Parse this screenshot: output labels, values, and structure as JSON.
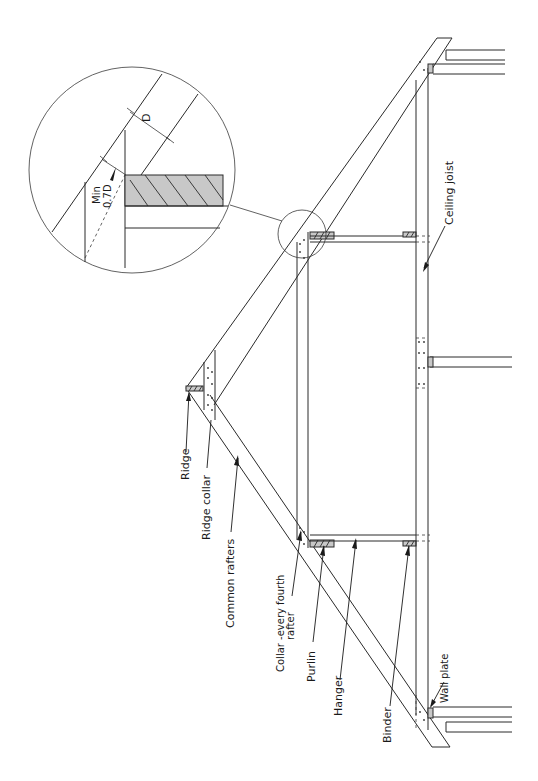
{
  "diagram": {
    "orientation": "rotated 90 degrees counter-clockwise",
    "labels": {
      "ridge": "Ridge",
      "ridge_collar": "Ridge collar",
      "common_rafters": "Common rafters",
      "collar_line1": "Collar -every fourth",
      "collar_line2": "rafter",
      "purlin": "Purlin",
      "hanger": "Hanger",
      "binder": "Binder",
      "wall_plate": "Wall plate",
      "ceiling_joist": "Ceiling joist"
    },
    "detail": {
      "name": "Purlin bearing detail",
      "min_label": "Min",
      "min_value": "0.7D",
      "depth_label": "D"
    },
    "colors": {
      "line": "#2a2a2a",
      "hatch_fill": "#c8c8c8",
      "background": "#ffffff"
    }
  }
}
